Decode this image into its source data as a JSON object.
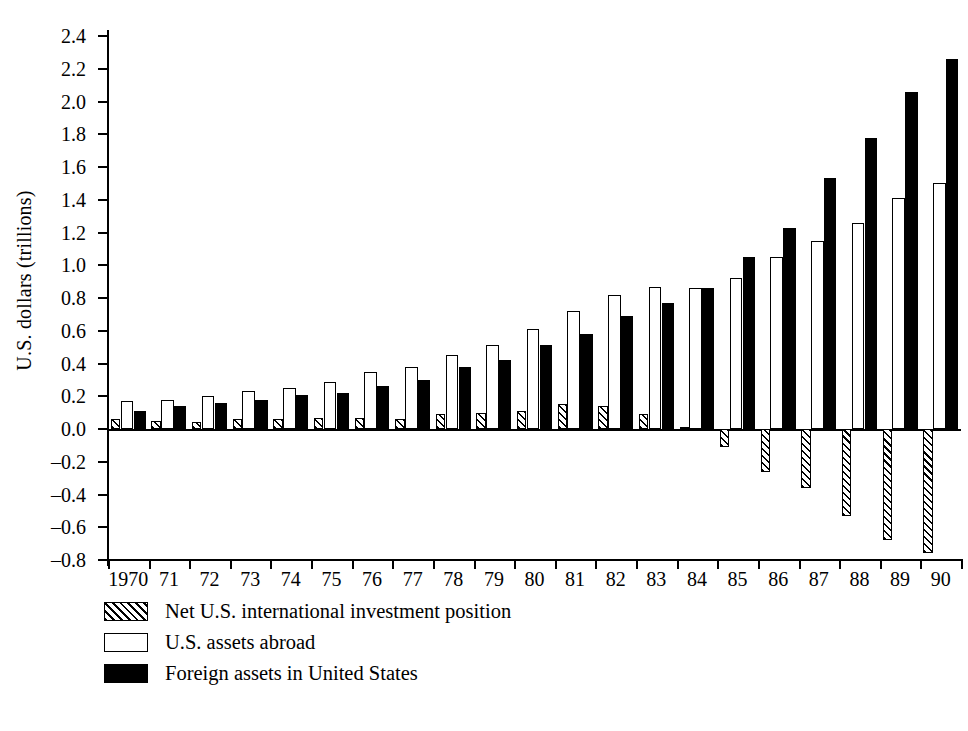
{
  "chart_data": {
    "type": "bar",
    "title": "",
    "xlabel": "",
    "ylabel": "U.S. dollars (trillions)",
    "ylim": [
      -0.8,
      2.4
    ],
    "ytick_labels": [
      "2.4",
      "2.2",
      "2.0",
      "1.8",
      "1.6",
      "1.4",
      "1.2",
      "1.0",
      "0.8",
      "0.6",
      "0.4",
      "0.2",
      "0.0",
      "–0.2",
      "–0.4",
      "–0.6",
      "–0.8"
    ],
    "ytick_values": [
      2.4,
      2.2,
      2.0,
      1.8,
      1.6,
      1.4,
      1.2,
      1.0,
      0.8,
      0.6,
      0.4,
      0.2,
      0.0,
      -0.2,
      -0.4,
      -0.6,
      -0.8
    ],
    "grid": false,
    "legend_position": "below-axis-left",
    "categories": [
      "1970",
      "71",
      "72",
      "73",
      "74",
      "75",
      "76",
      "77",
      "78",
      "79",
      "80",
      "81",
      "82",
      "83",
      "84",
      "85",
      "86",
      "87",
      "88",
      "89",
      "90"
    ],
    "series": [
      {
        "name": "Net U.S. international investment position",
        "style": "hatched",
        "values": [
          0.06,
          0.05,
          0.04,
          0.06,
          0.06,
          0.07,
          0.07,
          0.06,
          0.09,
          0.1,
          0.11,
          0.15,
          0.14,
          0.09,
          0.01,
          -0.11,
          -0.26,
          -0.36,
          -0.53,
          -0.68,
          -0.76
        ]
      },
      {
        "name": "U.S. assets abroad",
        "style": "white",
        "values": [
          0.17,
          0.18,
          0.2,
          0.23,
          0.25,
          0.29,
          0.35,
          0.38,
          0.45,
          0.51,
          0.61,
          0.72,
          0.82,
          0.87,
          0.86,
          0.92,
          1.05,
          1.15,
          1.26,
          1.41,
          1.5
        ]
      },
      {
        "name": "Foreign assets in United States",
        "style": "black",
        "values": [
          0.11,
          0.14,
          0.16,
          0.18,
          0.21,
          0.22,
          0.26,
          0.3,
          0.38,
          0.42,
          0.51,
          0.58,
          0.69,
          0.77,
          0.86,
          1.05,
          1.23,
          1.53,
          1.78,
          2.06,
          2.26
        ]
      }
    ]
  },
  "legend": {
    "items": [
      {
        "label": "Net U.S. international investment position",
        "swatch": "hatched-swatch"
      },
      {
        "label": "U.S. assets abroad",
        "swatch": "white-swatch"
      },
      {
        "label": "Foreign assets in United States",
        "swatch": "black-swatch"
      }
    ]
  }
}
